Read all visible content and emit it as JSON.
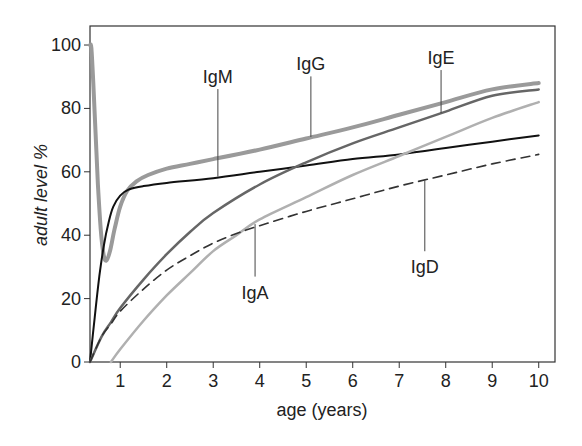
{
  "chart_data": {
    "type": "line",
    "title": "",
    "xlabel": "age (years)",
    "ylabel": "adult level %",
    "xlim": [
      0.35,
      10.35
    ],
    "ylim": [
      0,
      106
    ],
    "xticks": [
      1,
      2,
      3,
      4,
      5,
      6,
      7,
      8,
      9,
      10
    ],
    "yticks": [
      0,
      20,
      40,
      60,
      80,
      100
    ],
    "grid": false,
    "legend": "inline leader-line labels",
    "series": [
      {
        "name": "IgG",
        "color": "#9a9a9a",
        "width": 4,
        "dash": "",
        "x": [
          0.35,
          0.38,
          0.42,
          0.47,
          0.52,
          0.58,
          0.64,
          0.7,
          0.78,
          0.88,
          1.0,
          1.15,
          1.35,
          1.6,
          2.0,
          2.5,
          3.0,
          4.0,
          5.0,
          6.0,
          7.0,
          8.0,
          9.0,
          10.0
        ],
        "y": [
          100,
          99,
          88,
          72,
          56,
          42,
          34,
          32,
          35,
          42,
          49,
          54,
          57,
          59,
          61,
          62.5,
          64,
          67,
          70.5,
          74,
          78,
          82,
          86,
          88
        ]
      },
      {
        "name": "IgM",
        "color": "#111111",
        "width": 2,
        "dash": "",
        "x": [
          0.35,
          0.45,
          0.55,
          0.65,
          0.75,
          0.85,
          1.0,
          1.2,
          1.5,
          2.0,
          3.0,
          4.0,
          5.0,
          6.0,
          7.0,
          8.0,
          9.0,
          10.0
        ],
        "y": [
          0,
          14,
          27,
          37,
          44,
          49,
          52.5,
          54.5,
          55.5,
          56.5,
          58,
          60,
          62,
          64,
          65.5,
          67.5,
          69.5,
          71.5
        ]
      },
      {
        "name": "IgE",
        "color": "#666666",
        "width": 2.5,
        "dash": "",
        "x": [
          0.35,
          0.6,
          0.8,
          1.0,
          1.5,
          2.0,
          2.5,
          3.0,
          4.0,
          5.0,
          6.0,
          7.0,
          8.0,
          9.0,
          10.0
        ],
        "y": [
          0,
          8,
          12.5,
          17,
          26,
          34,
          41,
          47,
          56,
          63,
          69,
          74,
          79,
          84,
          86
        ]
      },
      {
        "name": "IgA",
        "color": "#b0b0b0",
        "width": 2.5,
        "dash": "",
        "x": [
          0.8,
          1.0,
          1.5,
          2.0,
          2.5,
          3.0,
          3.5,
          4.0,
          5.0,
          6.0,
          7.0,
          8.0,
          9.0,
          10.0
        ],
        "y": [
          0,
          4,
          13,
          21,
          28,
          35,
          40,
          45,
          52,
          59,
          65,
          71,
          77,
          82
        ]
      },
      {
        "name": "IgD",
        "color": "#333333",
        "width": 1.6,
        "dash": "9 6",
        "x": [
          0.35,
          0.6,
          0.8,
          1.0,
          1.5,
          2.0,
          2.5,
          3.0,
          3.5,
          4.0,
          5.0,
          6.0,
          7.0,
          8.0,
          9.0,
          10.0
        ],
        "y": [
          0,
          8,
          12,
          16,
          23,
          29,
          33.5,
          37.5,
          40.5,
          43,
          47.5,
          51.5,
          55.5,
          59,
          62.5,
          65.5
        ]
      }
    ],
    "annotations": [
      {
        "text": "IgM",
        "label_x": 3.1,
        "label_y": 88,
        "point_x": 3.1,
        "point_y": 58.5,
        "anchor": "top"
      },
      {
        "text": "IgG",
        "label_x": 5.1,
        "label_y": 92,
        "point_x": 5.1,
        "point_y": 71,
        "anchor": "top"
      },
      {
        "text": "IgE",
        "label_x": 7.9,
        "label_y": 94,
        "point_x": 7.9,
        "point_y": 78.5,
        "anchor": "top"
      },
      {
        "text": "IgA",
        "label_x": 3.9,
        "label_y": 20,
        "point_x": 3.9,
        "point_y": 43.5,
        "anchor": "bottom"
      },
      {
        "text": "IgD",
        "label_x": 7.55,
        "label_y": 28,
        "point_x": 7.55,
        "point_y": 57.5,
        "anchor": "bottom"
      }
    ]
  }
}
